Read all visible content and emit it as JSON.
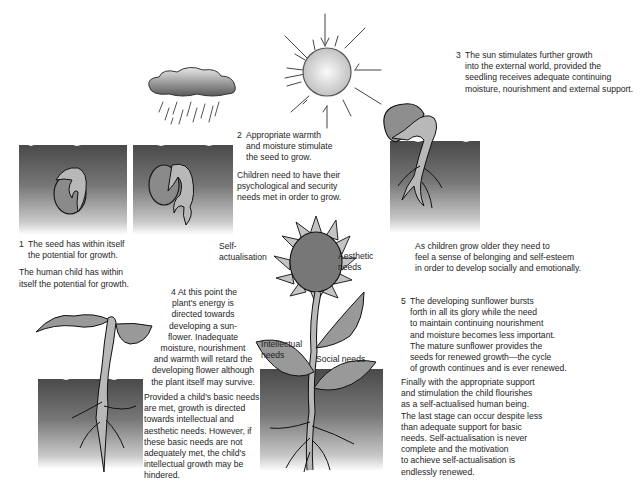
{
  "diagram": {
    "stages": [
      {
        "number": "1",
        "plant_text": [
          "The seed has within itself",
          "the potential for growth."
        ],
        "child_text": [
          "The human child has within",
          "itself the potential for growth."
        ]
      },
      {
        "number": "2",
        "plant_text": [
          "Appropriate warmth",
          "and moisture stimulate",
          "the seed to grow."
        ],
        "child_text": [
          "Children need to have their",
          "psychological and security",
          "needs met in order to grow."
        ]
      },
      {
        "number": "3",
        "plant_text": [
          "The sun stimulates further growth",
          "into the external world, provided the",
          "seedling receives adequate continuing",
          "moisture, nourishment and external support."
        ],
        "child_text": [
          "As children grow older they need to",
          "feel a sense of belonging and self-esteem",
          "in order to develop socially and emotionally."
        ]
      },
      {
        "number": "4",
        "plant_text": [
          "At this point the",
          "plant's energy is",
          "directed towards",
          "developing  a sun-",
          "flower. Inadequate",
          "moisture, nourishment",
          "and warmth will retard the",
          "developing  flower although",
          "the plant itself may survive."
        ],
        "child_text": [
          "Provided a child's basic needs",
          "are met, growth is directed",
          "towards intellectual and",
          "aesthetic needs. However, if",
          "these basic needs are not",
          "adequately met, the child's",
          "intellectual growth may be",
          "hindered."
        ]
      },
      {
        "number": "5",
        "plant_text": [
          "The developing sunflower bursts",
          "forth in all its glory while the need",
          "to maintain continuing nourishment",
          "and moisture becomes less important.",
          "The mature sunflower provides the",
          "seeds for renewed growth—the cycle",
          "of growth continues and is ever renewed."
        ],
        "child_text": [
          "Finally with the appropriate support",
          "and stimulation the child flourishes",
          "as a self-actualised human being.",
          "The last stage can occur despite less",
          "than adequate support for basic",
          "needs. Self-actualisation is never",
          "complete and the motivation",
          "to achieve self-actualisation is",
          "endlessly renewed."
        ]
      }
    ],
    "flower_labels": {
      "self_actualisation": [
        "Self-",
        "actualisation"
      ],
      "aesthetic": [
        "Aesthetic",
        "needs"
      ],
      "intellectual": [
        "Intellectual",
        "needs"
      ],
      "social": "Social needs"
    },
    "illustrations": [
      "sun-icon",
      "rain-cloud-icon",
      "seed-in-soil",
      "germinating-seed",
      "seedling",
      "young-plant",
      "mature-sunflower"
    ],
    "colors": {
      "soil_dark": "#4a4a4a",
      "plant_fill": "#b5b5b5",
      "outline": "#1a1a1a",
      "text": "#1e1e1e"
    }
  }
}
